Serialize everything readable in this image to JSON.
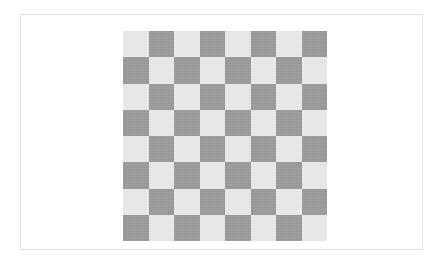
{
  "page": {
    "background_color": "#ffffff",
    "width": 441,
    "height": 265
  },
  "card": {
    "name": "image-frame",
    "border_color": "#e3e3e3",
    "background_color": "#ffffff"
  },
  "board": {
    "title": "Checkerboard",
    "rows": 8,
    "columns": 8,
    "light_color": "#e9e9e9",
    "dark_color": "#9a9a9a",
    "top_left_square": "light",
    "pattern": [
      [
        "light",
        "dark",
        "light",
        "dark",
        "light",
        "dark",
        "light",
        "dark"
      ],
      [
        "dark",
        "light",
        "dark",
        "light",
        "dark",
        "light",
        "dark",
        "light"
      ],
      [
        "light",
        "dark",
        "light",
        "dark",
        "light",
        "dark",
        "light",
        "dark"
      ],
      [
        "dark",
        "light",
        "dark",
        "light",
        "dark",
        "light",
        "dark",
        "light"
      ],
      [
        "light",
        "dark",
        "light",
        "dark",
        "light",
        "dark",
        "light",
        "dark"
      ],
      [
        "dark",
        "light",
        "dark",
        "light",
        "dark",
        "light",
        "dark",
        "light"
      ],
      [
        "light",
        "dark",
        "light",
        "dark",
        "light",
        "dark",
        "light",
        "dark"
      ],
      [
        "dark",
        "light",
        "dark",
        "light",
        "dark",
        "light",
        "dark",
        "light"
      ]
    ]
  }
}
